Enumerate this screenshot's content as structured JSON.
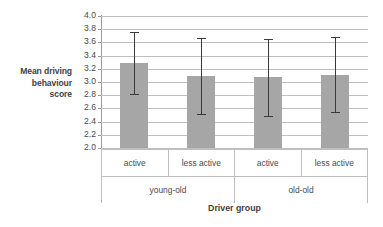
{
  "chart_data": {
    "type": "bar",
    "title": "",
    "xlabel": "Driver group",
    "ylabel": "Mean driving behaviour score",
    "ylabel_lines": [
      "Mean driving",
      "behaviour",
      "score"
    ],
    "ylim": [
      2.0,
      4.0
    ],
    "ytick_step": 0.2,
    "ytick_labels": [
      "4.0",
      "3.8",
      "3.6",
      "3.4",
      "3.2",
      "3.0",
      "2.8",
      "2.6",
      "2.4",
      "2.2",
      "2.0"
    ],
    "grid": true,
    "legend": "none",
    "bar_color": "#a6a6a6",
    "error_bar_color": "#3a3a3a",
    "gridline_color": "#bfbfbf",
    "categories": [
      "active",
      "less active",
      "active",
      "less active"
    ],
    "group_labels": [
      "young-old",
      "old-old"
    ],
    "values": [
      3.29,
      3.09,
      3.07,
      3.11
    ],
    "error_high": [
      3.76,
      3.66,
      3.65,
      3.68
    ],
    "error_low": [
      2.82,
      2.51,
      2.49,
      2.55
    ],
    "bars": [
      {
        "category": "active",
        "group": "young-old",
        "value": 3.29,
        "err_top": 3.76,
        "err_bottom": 2.82
      },
      {
        "category": "less active",
        "group": "young-old",
        "value": 3.09,
        "err_top": 3.66,
        "err_bottom": 2.51
      },
      {
        "category": "active",
        "group": "old-old",
        "value": 3.07,
        "err_top": 3.65,
        "err_bottom": 2.49
      },
      {
        "category": "less active",
        "group": "old-old",
        "value": 3.11,
        "err_top": 3.68,
        "err_bottom": 2.55
      }
    ]
  }
}
